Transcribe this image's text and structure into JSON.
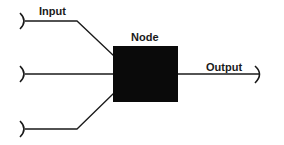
{
  "diagram": {
    "type": "neuron-node-diagram",
    "labels": {
      "input": "Input",
      "node": "Node",
      "output": "Output"
    },
    "colors": {
      "background": "#ffffff",
      "node_fill": "#0a0a0a",
      "line": "#1a1a1a",
      "text": "#1a1a1a"
    },
    "inputs": [
      {
        "id": "input-1",
        "y": 21
      },
      {
        "id": "input-2",
        "y": 74
      },
      {
        "id": "input-3",
        "y": 129
      }
    ],
    "node": {
      "x": 113,
      "y": 46,
      "width": 65,
      "height": 56
    },
    "output": {
      "y": 74
    }
  }
}
